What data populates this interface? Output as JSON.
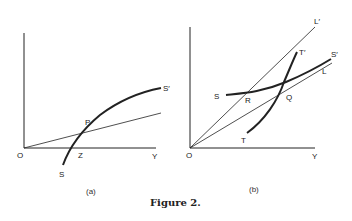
{
  "figure": {
    "title": "Figure 2.",
    "panels": [
      {
        "caption": "(a)",
        "labels": {
          "origin": "O",
          "x_axis": "Y",
          "intersection": "P",
          "x_intercept": "Z",
          "curve_start": "S",
          "curve_end": "S′"
        }
      },
      {
        "caption": "(b)",
        "labels": {
          "origin": "O",
          "x_axis": "Y",
          "curve_s_start": "S",
          "curve_s_end": "S′",
          "curve_t_start": "T",
          "curve_t_end": "T′",
          "line_steep": "L′",
          "line_shallow": "L",
          "point_r": "R",
          "point_q": "Q"
        }
      }
    ]
  },
  "colors": {
    "ink": "#222222",
    "background": "#ffffff"
  }
}
